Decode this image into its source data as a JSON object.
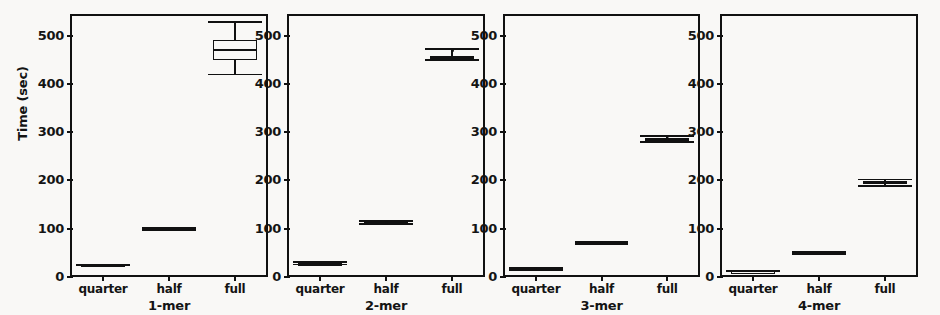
{
  "figure": {
    "ylabel": "Time (sec)",
    "background_color": "#f9f8f6",
    "line_color": "#111111"
  },
  "chart_data": {
    "type": "box",
    "title": "",
    "ylabel": "Time (sec)",
    "xlabel": "",
    "ylim": [
      0,
      545
    ],
    "yticks": [
      0,
      100,
      200,
      300,
      400,
      500
    ],
    "ytick_labels": [
      "0",
      "100",
      "200",
      "300",
      "400",
      "500"
    ],
    "categories": [
      "quarter",
      "half",
      "full"
    ],
    "grid": false,
    "legend": null,
    "panels": [
      {
        "xlabel": "1-mer",
        "boxes": [
          {
            "category": "quarter",
            "whisker_low": 24,
            "q1": 24.5,
            "median": 25,
            "q3": 25.5,
            "whisker_high": 26,
            "fliers": []
          },
          {
            "category": "half",
            "whisker_low": 98,
            "q1": 99,
            "median": 100,
            "q3": 101,
            "whisker_high": 102,
            "fliers": []
          },
          {
            "category": "full",
            "whisker_low": 420,
            "q1": 450,
            "median": 470,
            "q3": 492,
            "whisker_high": 528,
            "fliers": []
          }
        ]
      },
      {
        "xlabel": "2-mer",
        "boxes": [
          {
            "category": "quarter",
            "whisker_low": 26,
            "q1": 27,
            "median": 28,
            "q3": 29,
            "whisker_high": 31,
            "fliers": [
              28
            ]
          },
          {
            "category": "half",
            "whisker_low": 110,
            "q1": 112,
            "median": 113,
            "q3": 114,
            "whisker_high": 116,
            "fliers": [
              113
            ]
          },
          {
            "category": "full",
            "whisker_low": 450,
            "q1": 452,
            "median": 455,
            "q3": 458,
            "whisker_high": 472,
            "fliers": [
              470
            ]
          }
        ]
      },
      {
        "xlabel": "3-mer",
        "boxes": [
          {
            "category": "quarter",
            "whisker_low": 15,
            "q1": 16,
            "median": 17,
            "q3": 18,
            "whisker_high": 19,
            "fliers": [
              17
            ]
          },
          {
            "category": "half",
            "whisker_low": 68,
            "q1": 69,
            "median": 70,
            "q3": 71,
            "whisker_high": 73,
            "fliers": [
              71
            ]
          },
          {
            "category": "full",
            "whisker_low": 280,
            "q1": 283,
            "median": 285,
            "q3": 288,
            "whisker_high": 292,
            "fliers": [
              286
            ]
          }
        ]
      },
      {
        "xlabel": "4-mer",
        "boxes": [
          {
            "category": "quarter",
            "whisker_low": 11,
            "q1": 11.5,
            "median": 12,
            "q3": 12.5,
            "whisker_high": 13,
            "fliers": []
          },
          {
            "category": "half",
            "whisker_low": 48,
            "q1": 49,
            "median": 50,
            "q3": 51,
            "whisker_high": 52,
            "fliers": []
          },
          {
            "category": "full",
            "whisker_low": 188,
            "q1": 192,
            "median": 195,
            "q3": 198,
            "whisker_high": 202,
            "fliers": []
          }
        ]
      }
    ]
  }
}
